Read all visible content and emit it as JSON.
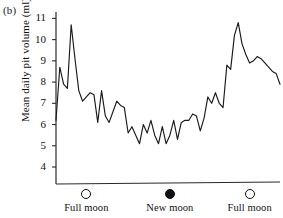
{
  "figure": {
    "panel_label": "(b)",
    "ylabel": "Mean daily pit volume (ml)"
  },
  "chart_data": {
    "type": "line",
    "title": "",
    "xlabel": "",
    "ylabel": "Mean daily pit volume (ml)",
    "ylim": [
      3.2,
      11.3
    ],
    "yticks": [
      4,
      5,
      6,
      7,
      8,
      9,
      10,
      11
    ],
    "ytick_labels": [
      "4",
      "5",
      "6",
      "7",
      "8",
      "9",
      "10",
      "11"
    ],
    "xlim": [
      0,
      59
    ],
    "grid": false,
    "legend": null,
    "x_categories": [
      {
        "label": "Full moon",
        "marker": "open-circle",
        "x": 8
      },
      {
        "label": "New moon",
        "marker": "filled-circle",
        "x": 30
      },
      {
        "label": "Full moon",
        "marker": "open-circle",
        "x": 51
      }
    ],
    "series": [
      {
        "name": "Mean daily pit volume",
        "color": "#1a1a1a",
        "x": [
          0,
          1,
          2,
          3,
          4,
          5,
          6,
          7,
          8,
          9,
          10,
          11,
          12,
          13,
          14,
          15,
          16,
          17,
          18,
          19,
          20,
          21,
          22,
          23,
          24,
          25,
          26,
          27,
          28,
          29,
          30,
          31,
          32,
          33,
          34,
          35,
          36,
          37,
          38,
          39,
          40,
          41,
          42,
          43,
          44,
          45,
          46,
          47,
          48,
          49,
          50,
          51,
          52,
          53,
          54,
          55,
          56,
          57,
          58,
          59
        ],
        "values": [
          6.2,
          8.7,
          7.9,
          7.7,
          10.7,
          9.1,
          7.6,
          7.1,
          7.3,
          7.5,
          7.4,
          6.1,
          7.6,
          6.4,
          6.1,
          6.6,
          7.1,
          6.9,
          6.8,
          5.6,
          5.9,
          5.5,
          5.1,
          6.0,
          5.6,
          6.2,
          5.5,
          5.1,
          5.9,
          5.1,
          5.5,
          6.2,
          5.3,
          6.1,
          6.2,
          6.2,
          6.5,
          6.4,
          5.7,
          6.3,
          7.3,
          7.0,
          7.5,
          7.0,
          6.8,
          8.8,
          8.6,
          10.2,
          10.8,
          9.8,
          9.3,
          8.9,
          9.0,
          9.2,
          9.1,
          8.9,
          8.7,
          8.5,
          8.4,
          7.9
        ]
      }
    ]
  }
}
